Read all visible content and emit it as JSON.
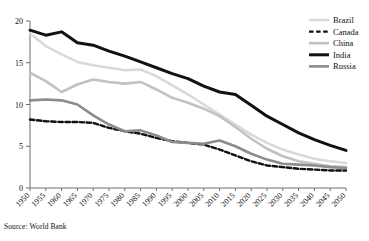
{
  "source_note": "Source: World Bank",
  "chart_data": {
    "type": "line",
    "title": "",
    "xlabel": "",
    "ylabel": "",
    "xlim": [
      1950,
      2050
    ],
    "ylim": [
      0,
      20
    ],
    "yticks": [
      0,
      5,
      10,
      15,
      20
    ],
    "ytick_labels": [
      "0",
      "5",
      "10",
      "15",
      "20"
    ],
    "grid": false,
    "legend_position": "top-right",
    "x": [
      1950,
      1955,
      1960,
      1965,
      1970,
      1975,
      1980,
      1985,
      1990,
      1995,
      2000,
      2005,
      2010,
      2015,
      2020,
      2025,
      2030,
      2035,
      2040,
      2045,
      2050
    ],
    "xtick_labels": [
      "1950",
      "1955",
      "1960",
      "1965",
      "1970",
      "1975",
      "1980",
      "1985",
      "1990",
      "1995",
      "2000",
      "2005",
      "2010",
      "2015",
      "2020",
      "2025",
      "2030",
      "2035",
      "2040",
      "2045",
      "2050"
    ],
    "series": [
      {
        "name": "Brazil",
        "color": "#d9d9d9",
        "style": "solid",
        "width": 2.6,
        "values": [
          18.5,
          17.0,
          16.0,
          15.1,
          14.7,
          14.4,
          14.1,
          14.2,
          13.4,
          12.3,
          11.2,
          10.0,
          8.8,
          7.6,
          6.4,
          5.4,
          4.6,
          4.0,
          3.5,
          3.2,
          3.0
        ]
      },
      {
        "name": "Canada",
        "color": "#111111",
        "style": "dashed",
        "width": 2.4,
        "values": [
          8.2,
          8.0,
          7.9,
          7.9,
          7.8,
          7.2,
          6.8,
          6.5,
          6.0,
          5.6,
          5.4,
          5.2,
          4.6,
          3.9,
          3.2,
          2.7,
          2.5,
          2.3,
          2.2,
          2.1,
          2.1
        ]
      },
      {
        "name": "China",
        "color": "#c2c2c2",
        "style": "solid",
        "width": 2.6,
        "values": [
          13.8,
          12.8,
          11.5,
          12.4,
          13.0,
          12.7,
          12.5,
          12.7,
          11.8,
          10.8,
          10.2,
          9.5,
          8.6,
          7.3,
          5.9,
          4.7,
          3.8,
          3.2,
          2.9,
          2.6,
          2.5
        ]
      },
      {
        "name": "India",
        "color": "#111111",
        "style": "solid",
        "width": 3.0,
        "values": [
          18.9,
          18.3,
          18.7,
          17.4,
          17.1,
          16.4,
          15.8,
          15.1,
          14.4,
          13.7,
          13.1,
          12.2,
          11.5,
          11.2,
          9.9,
          8.6,
          7.6,
          6.6,
          5.8,
          5.1,
          4.5
        ]
      },
      {
        "name": "Russia",
        "color": "#8c8c8c",
        "style": "solid",
        "width": 2.6,
        "values": [
          10.5,
          10.6,
          10.5,
          10.0,
          8.7,
          7.6,
          6.8,
          6.9,
          6.3,
          5.5,
          5.4,
          5.3,
          5.7,
          5.0,
          4.1,
          3.4,
          2.9,
          2.8,
          2.7,
          2.5,
          2.4
        ]
      }
    ]
  },
  "legend": {
    "items": [
      {
        "label": "Brazil"
      },
      {
        "label": "Canada"
      },
      {
        "label": "China"
      },
      {
        "label": "India"
      },
      {
        "label": "Russia"
      }
    ]
  }
}
